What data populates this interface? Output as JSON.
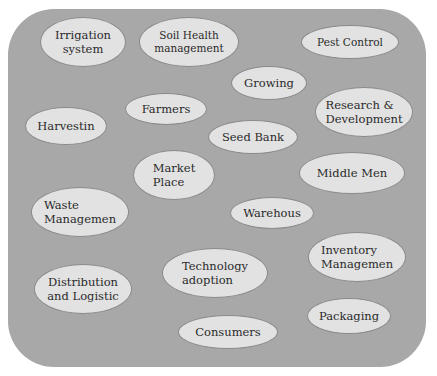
{
  "diagram": {
    "background_color": "#a8a8a8",
    "node_color": "#e2e2e2",
    "text_color": "#2a2a2a",
    "nodes": [
      {
        "id": "irrigation-system",
        "label": "Irrigation\nsystem",
        "x": 40,
        "y": 17,
        "w": 86,
        "h": 50
      },
      {
        "id": "soil-health-management",
        "label": "Soil Health\nmanagement",
        "x": 139,
        "y": 17,
        "w": 100,
        "h": 50
      },
      {
        "id": "pest-control",
        "label": "Pest Control",
        "x": 301,
        "y": 25,
        "w": 98,
        "h": 34
      },
      {
        "id": "growing",
        "label": "Growing",
        "x": 231,
        "y": 66,
        "w": 76,
        "h": 34
      },
      {
        "id": "farmers",
        "label": "Farmers",
        "x": 125,
        "y": 93,
        "w": 82,
        "h": 32
      },
      {
        "id": "research-development",
        "label": "Research &\nDevelopment",
        "x": 315,
        "y": 87,
        "w": 98,
        "h": 50
      },
      {
        "id": "harvestin",
        "label": "Harvestin",
        "x": 25,
        "y": 107,
        "w": 82,
        "h": 38
      },
      {
        "id": "seed-bank",
        "label": "Seed Bank",
        "x": 208,
        "y": 120,
        "w": 90,
        "h": 34
      },
      {
        "id": "market-place",
        "label": "Market\nPlace",
        "x": 133,
        "y": 150,
        "w": 82,
        "h": 50
      },
      {
        "id": "middle-men",
        "label": "Middle Men",
        "x": 299,
        "y": 152,
        "w": 106,
        "h": 42
      },
      {
        "id": "waste-management",
        "label": "Waste\nManagemen",
        "x": 31,
        "y": 187,
        "w": 98,
        "h": 50
      },
      {
        "id": "warehouse",
        "label": "Warehous",
        "x": 230,
        "y": 197,
        "w": 84,
        "h": 32
      },
      {
        "id": "inventory-management",
        "label": "Inventory\nManagemen",
        "x": 308,
        "y": 232,
        "w": 98,
        "h": 50
      },
      {
        "id": "distribution-logistic",
        "label": "Distribution\nand Logistic",
        "x": 34,
        "y": 264,
        "w": 98,
        "h": 50
      },
      {
        "id": "technology-adoption",
        "label": "Technology\nadoption",
        "x": 162,
        "y": 248,
        "w": 106,
        "h": 50
      },
      {
        "id": "consumers",
        "label": "Consumers",
        "x": 178,
        "y": 315,
        "w": 100,
        "h": 34
      },
      {
        "id": "packaging",
        "label": "Packaging",
        "x": 307,
        "y": 298,
        "w": 84,
        "h": 36
      }
    ]
  }
}
